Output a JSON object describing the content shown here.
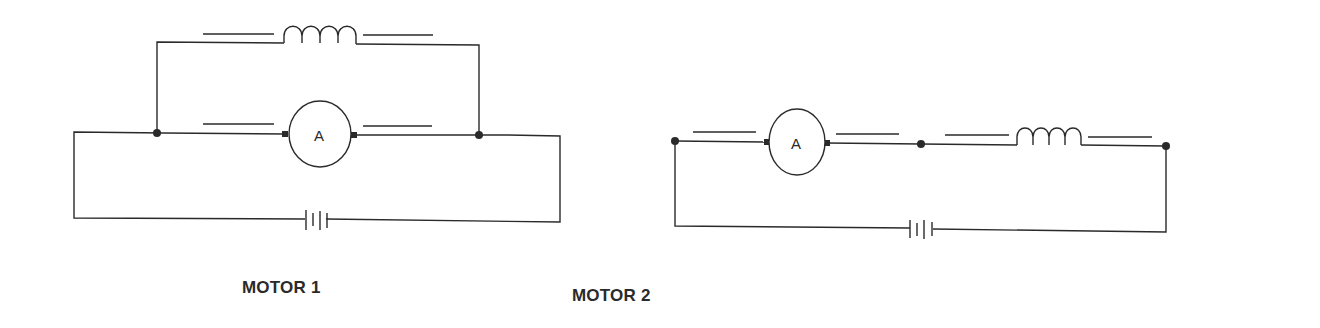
{
  "diagram": {
    "type": "dc-motor-circuits",
    "colors": {
      "ink": "#2a2a2a",
      "background": "#ffffff"
    },
    "circuits": [
      {
        "id": "motor1",
        "caption": "MOTOR 1",
        "topology": "parallel (shunt)",
        "armature_symbol": "A",
        "components": [
          "armature",
          "field-coil",
          "battery"
        ],
        "junctions": 2
      },
      {
        "id": "motor2",
        "caption": "MOTOR 2",
        "topology": "series",
        "armature_symbol": "A",
        "components": [
          "armature",
          "field-coil",
          "battery"
        ],
        "junctions": 3
      }
    ]
  }
}
